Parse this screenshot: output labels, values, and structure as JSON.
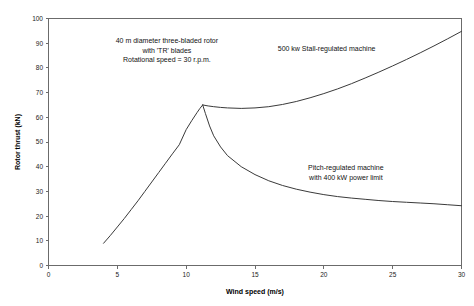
{
  "chart_data": {
    "type": "line",
    "title": "",
    "xlabel": "Wind speed (m/s)",
    "ylabel": "Rotor thrust (kN)",
    "xlim": [
      0,
      30
    ],
    "ylim": [
      0,
      100
    ],
    "xticks": [
      0,
      5,
      10,
      15,
      20,
      25,
      30
    ],
    "yticks": [
      0,
      10,
      20,
      30,
      40,
      50,
      60,
      70,
      80,
      90,
      100
    ],
    "grid": false,
    "legend": "none",
    "line_color": "#3a3a3a",
    "frame_color": "#6b6b6b",
    "series": [
      {
        "name": "Common rotor thrust branch (below rated wind speed)",
        "x": [
          4.0,
          4.5,
          5.0,
          5.5,
          6.0,
          6.5,
          7.0,
          7.5,
          8.0,
          8.5,
          9.0,
          9.5,
          10.0,
          10.4,
          10.8,
          11.0,
          11.2
        ],
        "values": [
          9.0,
          12.2,
          15.6,
          19.0,
          22.6,
          26.2,
          30.0,
          33.8,
          37.6,
          41.4,
          45.2,
          48.9,
          55.0,
          58.6,
          62.0,
          63.6,
          65.0
        ]
      },
      {
        "name": "500 kw Stall-regulated machine",
        "x": [
          11.2,
          11.6,
          12.0,
          12.5,
          13.0,
          14.0,
          15.0,
          16.0,
          17.0,
          18.0,
          19.0,
          20.0,
          21.0,
          22.0,
          23.0,
          24.0,
          25.0,
          26.0,
          27.0,
          28.0,
          29.0,
          30.0
        ],
        "values": [
          65.0,
          64.6,
          64.3,
          64.0,
          63.8,
          63.6,
          63.8,
          64.3,
          65.2,
          66.4,
          67.9,
          69.6,
          71.5,
          73.6,
          75.9,
          78.3,
          80.8,
          83.4,
          86.1,
          88.9,
          91.8,
          94.8
        ]
      },
      {
        "name": "Pitch-regulated machine with 400 kW power limit",
        "x": [
          11.2,
          11.4,
          11.7,
          12.0,
          12.5,
          13.0,
          14.0,
          15.0,
          16.0,
          17.0,
          18.0,
          19.0,
          20.0,
          21.0,
          22.0,
          23.0,
          24.0,
          25.0,
          26.0,
          27.0,
          28.0,
          29.0,
          30.0
        ],
        "values": [
          65.0,
          61.5,
          56.5,
          52.5,
          48.0,
          44.5,
          40.0,
          36.8,
          34.3,
          32.4,
          30.9,
          29.7,
          28.7,
          27.9,
          27.3,
          26.8,
          26.3,
          25.9,
          25.6,
          25.3,
          25.0,
          24.6,
          24.2
        ]
      }
    ],
    "annotations": [
      {
        "name": "rotor-spec",
        "lines": [
          "40 m diameter three-bladed rotor",
          "with 'TR' blades",
          "Rotational speed = 30 r.p.m."
        ],
        "x": 8.6,
        "y": 90.0
      },
      {
        "name": "stall-label",
        "lines": [
          "500 kw Stall-regulated machine"
        ],
        "x": 20.2,
        "y": 87.0
      },
      {
        "name": "pitch-label",
        "lines": [
          "Pitch-regulated machine",
          "with 400 kW power limit"
        ],
        "x": 21.6,
        "y": 38.5
      }
    ]
  }
}
